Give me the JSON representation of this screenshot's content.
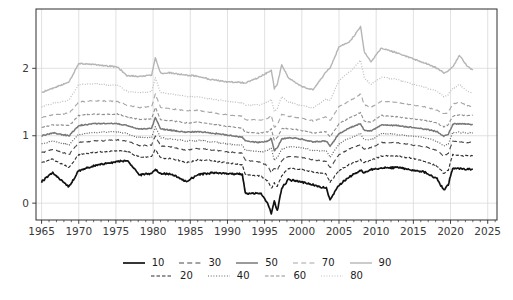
{
  "figure": {
    "background": "#ffffff",
    "frame_color": "#2e2e2e",
    "grid_color": "#d9d9d9",
    "tick_label_color": "#3a3a3a"
  },
  "chart_data": {
    "type": "line",
    "title": "",
    "xlabel": "",
    "ylabel": "",
    "grid": true,
    "legend_position": "bottom-center",
    "xlim": [
      1964.25,
      2026.25
    ],
    "ylim": [
      -0.25,
      2.88
    ],
    "x_ticks": [
      1965,
      1970,
      1975,
      1980,
      1985,
      1990,
      1995,
      2000,
      2005,
      2010,
      2015,
      2020,
      2025
    ],
    "x_tick_labels": [
      "1965",
      "1970",
      "1975",
      "1980",
      "1985",
      "1990",
      "1995",
      "2000",
      "2005",
      "2010",
      "2015",
      "2020",
      "2025"
    ],
    "x_minor_tick_step": 1,
    "y_ticks": [
      0,
      1,
      2
    ],
    "y_tick_labels": [
      "0",
      "1",
      "2"
    ],
    "x_keypoints": [
      1965,
      1966.5,
      1968.7,
      1970,
      1972,
      1975.2,
      1976.5,
      1978.2,
      1979.8,
      1980.3,
      1981,
      1982.5,
      1984.5,
      1986,
      1988,
      1990,
      1992,
      1992.4,
      1994.5,
      1995.4,
      1995.9,
      1996.3,
      1996.7,
      1997.3,
      1998.2,
      2000,
      2001.5,
      2003.3,
      2003.8,
      2005,
      2006.5,
      2007.9,
      2008.4,
      2009.3,
      2010.7,
      2013,
      2015,
      2016.5,
      2018.2,
      2019.1,
      2019.7,
      2020.3,
      2021.2,
      2022.2,
      2023
    ],
    "series": [
      {
        "name": "10",
        "percentile": 10,
        "color": "#111111",
        "dash": "",
        "width": 1.7,
        "noise": 0.02,
        "values": [
          0.32,
          0.45,
          0.24,
          0.48,
          0.55,
          0.62,
          0.63,
          0.42,
          0.44,
          0.5,
          0.44,
          0.43,
          0.32,
          0.42,
          0.45,
          0.44,
          0.43,
          0.15,
          0.14,
          0.0,
          -0.15,
          0.03,
          -0.12,
          0.22,
          0.35,
          0.31,
          0.27,
          0.22,
          0.05,
          0.27,
          0.4,
          0.48,
          0.45,
          0.5,
          0.52,
          0.53,
          0.49,
          0.46,
          0.36,
          0.19,
          0.28,
          0.52,
          0.51,
          0.5,
          0.51
        ]
      },
      {
        "name": "20",
        "percentile": 20,
        "color": "#2e2e2e",
        "dash": "3.5 2",
        "width": 1.1,
        "noise": 0.016,
        "values": [
          0.6,
          0.65,
          0.53,
          0.72,
          0.75,
          0.78,
          0.77,
          0.68,
          0.69,
          0.8,
          0.67,
          0.66,
          0.6,
          0.64,
          0.63,
          0.6,
          0.57,
          0.42,
          0.4,
          0.33,
          0.22,
          0.3,
          0.25,
          0.4,
          0.52,
          0.5,
          0.46,
          0.43,
          0.31,
          0.48,
          0.58,
          0.64,
          0.6,
          0.64,
          0.7,
          0.7,
          0.66,
          0.62,
          0.55,
          0.44,
          0.49,
          0.72,
          0.71,
          0.7,
          0.7
        ]
      },
      {
        "name": "30",
        "percentile": 30,
        "color": "#494949",
        "dash": "5 3.2",
        "width": 1.1,
        "noise": 0.014,
        "values": [
          0.75,
          0.8,
          0.72,
          0.9,
          0.92,
          0.94,
          0.92,
          0.85,
          0.86,
          1.0,
          0.85,
          0.83,
          0.79,
          0.81,
          0.79,
          0.76,
          0.74,
          0.63,
          0.61,
          0.55,
          0.45,
          0.52,
          0.48,
          0.63,
          0.7,
          0.68,
          0.64,
          0.62,
          0.52,
          0.72,
          0.81,
          0.87,
          0.8,
          0.82,
          0.9,
          0.89,
          0.86,
          0.84,
          0.78,
          0.7,
          0.74,
          0.92,
          0.91,
          0.9,
          0.9
        ]
      },
      {
        "name": "40",
        "percentile": 40,
        "color": "#636363",
        "dash": "1 1.7",
        "width": 1.2,
        "noise": 0.013,
        "values": [
          0.88,
          0.92,
          0.86,
          1.02,
          1.05,
          1.06,
          1.03,
          0.97,
          0.98,
          1.13,
          0.97,
          0.95,
          0.92,
          0.93,
          0.91,
          0.88,
          0.86,
          0.78,
          0.76,
          0.78,
          0.82,
          0.63,
          0.67,
          0.8,
          0.84,
          0.82,
          0.78,
          0.78,
          0.68,
          0.88,
          0.97,
          1.03,
          0.94,
          0.94,
          1.03,
          1.02,
          0.99,
          0.97,
          0.92,
          0.85,
          0.88,
          1.05,
          1.05,
          1.04,
          1.04
        ]
      },
      {
        "name": "50",
        "percentile": 50,
        "color": "#787878",
        "dash": "",
        "width": 1.5,
        "noise": 0.013,
        "values": [
          1.0,
          1.04,
          1.0,
          1.15,
          1.18,
          1.18,
          1.15,
          1.1,
          1.11,
          1.27,
          1.1,
          1.08,
          1.05,
          1.06,
          1.04,
          1.01,
          0.98,
          0.92,
          0.9,
          0.92,
          0.96,
          0.78,
          0.82,
          0.95,
          0.97,
          0.95,
          0.91,
          0.92,
          0.84,
          1.03,
          1.12,
          1.18,
          1.08,
          1.07,
          1.16,
          1.15,
          1.12,
          1.1,
          1.06,
          0.99,
          1.02,
          1.17,
          1.18,
          1.17,
          1.17
        ]
      },
      {
        "name": "60",
        "percentile": 60,
        "color": "#8f8f8f",
        "dash": "3.5 2",
        "width": 1.1,
        "noise": 0.013,
        "values": [
          1.12,
          1.16,
          1.15,
          1.3,
          1.32,
          1.32,
          1.28,
          1.24,
          1.25,
          1.42,
          1.24,
          1.22,
          1.19,
          1.2,
          1.17,
          1.14,
          1.11,
          1.05,
          1.04,
          1.06,
          1.1,
          0.93,
          0.97,
          1.1,
          1.11,
          1.08,
          1.04,
          1.06,
          0.98,
          1.18,
          1.27,
          1.34,
          1.22,
          1.2,
          1.3,
          1.28,
          1.25,
          1.23,
          1.19,
          1.13,
          1.16,
          1.29,
          1.31,
          1.3,
          1.3
        ]
      },
      {
        "name": "70",
        "percentile": 70,
        "color": "#a6a6a6",
        "dash": "5 3.2",
        "width": 1.1,
        "noise": 0.013,
        "values": [
          1.27,
          1.31,
          1.33,
          1.5,
          1.52,
          1.51,
          1.45,
          1.42,
          1.43,
          1.62,
          1.42,
          1.4,
          1.37,
          1.38,
          1.34,
          1.31,
          1.29,
          1.24,
          1.23,
          1.26,
          1.3,
          1.12,
          1.16,
          1.32,
          1.29,
          1.26,
          1.22,
          1.28,
          1.22,
          1.43,
          1.52,
          1.62,
          1.46,
          1.42,
          1.51,
          1.49,
          1.45,
          1.43,
          1.38,
          1.32,
          1.35,
          1.47,
          1.5,
          1.45,
          1.43
        ]
      },
      {
        "name": "80",
        "percentile": 80,
        "color": "#bdbdbd",
        "dash": "1 1.7",
        "width": 1.2,
        "noise": 0.013,
        "values": [
          1.43,
          1.48,
          1.53,
          1.76,
          1.77,
          1.75,
          1.66,
          1.64,
          1.65,
          1.86,
          1.64,
          1.62,
          1.58,
          1.58,
          1.54,
          1.51,
          1.49,
          1.45,
          1.46,
          1.5,
          1.54,
          1.36,
          1.4,
          1.58,
          1.5,
          1.45,
          1.41,
          1.55,
          1.52,
          1.82,
          1.95,
          2.12,
          1.86,
          1.76,
          1.87,
          1.83,
          1.76,
          1.72,
          1.66,
          1.58,
          1.61,
          1.7,
          1.76,
          1.67,
          1.63
        ]
      },
      {
        "name": "90",
        "percentile": 90,
        "color": "#b5b5b5",
        "dash": "",
        "width": 1.4,
        "noise": 0.016,
        "values": [
          1.64,
          1.7,
          1.8,
          2.07,
          2.06,
          2.02,
          1.89,
          1.88,
          1.9,
          2.16,
          1.93,
          1.93,
          1.9,
          1.88,
          1.83,
          1.8,
          1.79,
          1.78,
          1.88,
          1.94,
          1.97,
          1.7,
          1.76,
          2.06,
          1.86,
          1.73,
          1.68,
          1.95,
          2.0,
          2.32,
          2.4,
          2.62,
          2.25,
          2.1,
          2.3,
          2.22,
          2.14,
          2.08,
          2.0,
          1.93,
          1.96,
          2.02,
          2.19,
          2.04,
          1.97
        ]
      }
    ],
    "legend_rows": [
      [
        "10",
        "30",
        "50",
        "70",
        "90"
      ],
      [
        "20",
        "40",
        "60",
        "80"
      ]
    ]
  }
}
